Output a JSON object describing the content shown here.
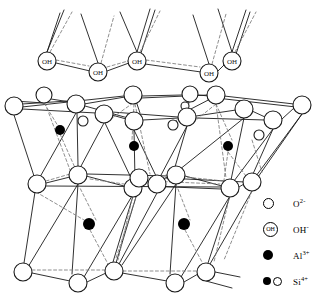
{
  "figure": {
    "kind": "crystal-structure-diagram",
    "colors": {
      "line": "#1a1a1a",
      "dashed": "#6b6b6b",
      "fill_ion": "#000000",
      "background": "#ffffff"
    }
  },
  "legend": {
    "items": [
      {
        "symbol": "open-circle",
        "label": "O",
        "charge": "2-",
        "name": "oxide-ion"
      },
      {
        "symbol": "labeled-circle",
        "label": "OH",
        "charge": "-",
        "name": "hydroxide-ion",
        "inner_text": "OH"
      },
      {
        "symbol": "filled-circle",
        "label": "Al",
        "charge": "3+",
        "name": "aluminium-ion"
      },
      {
        "symbol": "filled-and-open-circle",
        "label": "Si",
        "charge": "4+",
        "name": "silicon-ion"
      }
    ]
  },
  "atoms": {
    "oh_top": [
      {
        "x": 47,
        "y": 61,
        "r": 9,
        "text": "OH"
      },
      {
        "x": 98,
        "y": 72,
        "r": 9,
        "text": "OH"
      },
      {
        "x": 137,
        "y": 61,
        "r": 9,
        "text": "OH"
      },
      {
        "x": 209,
        "y": 73,
        "r": 9,
        "text": "OH"
      },
      {
        "x": 232,
        "y": 61,
        "r": 9,
        "text": "OH"
      }
    ],
    "o_upper_back": [
      {
        "x": 44,
        "y": 95,
        "r": 8
      },
      {
        "x": 133,
        "y": 95,
        "r": 9
      },
      {
        "x": 190,
        "y": 94,
        "r": 8
      },
      {
        "x": 216,
        "y": 95,
        "r": 9
      }
    ],
    "o_upper_front": [
      {
        "x": 14,
        "y": 106,
        "r": 9
      },
      {
        "x": 76,
        "y": 104,
        "r": 9
      },
      {
        "x": 104,
        "y": 114,
        "r": 9
      },
      {
        "x": 134,
        "y": 121,
        "r": 9
      },
      {
        "x": 187,
        "y": 117,
        "r": 9
      },
      {
        "x": 244,
        "y": 109,
        "r": 9
      },
      {
        "x": 273,
        "y": 120,
        "r": 9
      },
      {
        "x": 302,
        "y": 105,
        "r": 9
      }
    ],
    "o_middle": [
      {
        "x": 37,
        "y": 184,
        "r": 9
      },
      {
        "x": 78,
        "y": 175,
        "r": 9
      },
      {
        "x": 133,
        "y": 188,
        "r": 9
      },
      {
        "x": 139,
        "y": 178,
        "r": 9
      },
      {
        "x": 157,
        "y": 184,
        "r": 9
      },
      {
        "x": 176,
        "y": 175,
        "r": 9
      },
      {
        "x": 230,
        "y": 188,
        "r": 9
      },
      {
        "x": 252,
        "y": 182,
        "r": 9
      }
    ],
    "o_bottom": [
      {
        "x": 23,
        "y": 272,
        "r": 9
      },
      {
        "x": 78,
        "y": 283,
        "r": 9
      },
      {
        "x": 114,
        "y": 271,
        "r": 9
      },
      {
        "x": 175,
        "y": 283,
        "r": 9
      },
      {
        "x": 206,
        "y": 272,
        "r": 9
      }
    ],
    "al": [
      {
        "x": 60,
        "y": 130,
        "r": 5
      },
      {
        "x": 134,
        "y": 146,
        "r": 5
      },
      {
        "x": 228,
        "y": 146,
        "r": 5
      },
      {
        "x": 89,
        "y": 224,
        "r": 6
      },
      {
        "x": 184,
        "y": 224,
        "r": 6
      }
    ],
    "si": [
      {
        "x": 83,
        "y": 121,
        "r": 5
      },
      {
        "x": 173,
        "y": 125,
        "r": 5
      },
      {
        "x": 259,
        "y": 135,
        "r": 5
      },
      {
        "x": 185,
        "y": 106,
        "r": 4
      }
    ]
  }
}
